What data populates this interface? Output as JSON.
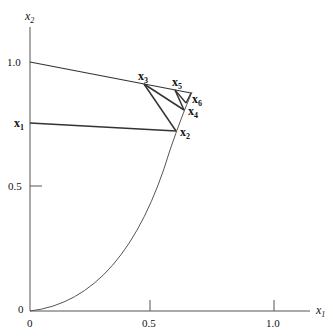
{
  "diagram": {
    "axes": {
      "x_label": "x",
      "x_sub": "1",
      "y_label": "x",
      "y_sub": "2",
      "x_ticks": [
        "0",
        "0.5",
        "1.0"
      ],
      "y_ticks": [
        "0",
        "0.5",
        "1.0"
      ]
    },
    "points": {
      "p1": {
        "name": "x",
        "sub": "1"
      },
      "p2": {
        "name": "x",
        "sub": "2"
      },
      "p3": {
        "name": "x",
        "sub": "3"
      },
      "p4": {
        "name": "x",
        "sub": "4"
      },
      "p5": {
        "name": "x",
        "sub": "5"
      },
      "p6": {
        "name": "x",
        "sub": "6"
      }
    },
    "colors": {
      "line": "#333333",
      "curve": "#555555"
    }
  }
}
